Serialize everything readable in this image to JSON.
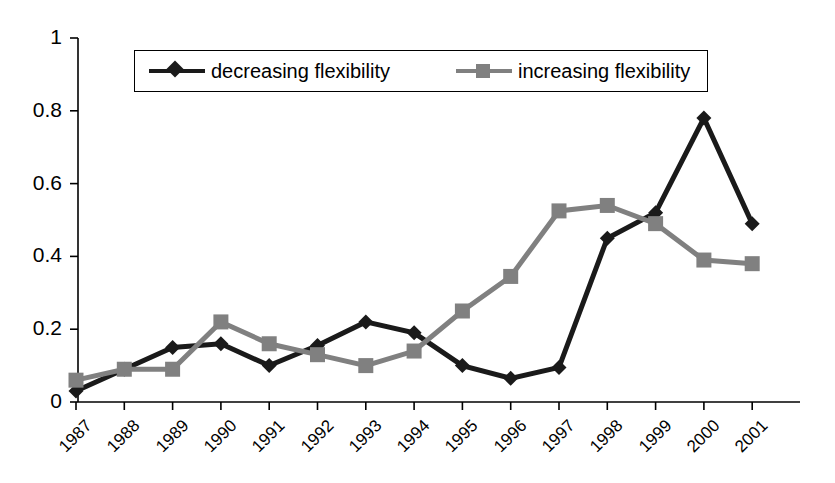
{
  "chart_data": {
    "type": "line",
    "title": "",
    "subtitle": "",
    "xlabel": "",
    "ylabel": "",
    "grid": false,
    "legend_position": "top-center",
    "ylim": [
      0,
      1
    ],
    "yticks": [
      "0",
      "0.2",
      "0.4",
      "0.6",
      "0.8",
      "1"
    ],
    "ytick_values": [
      0,
      0.2,
      0.4,
      0.6,
      0.8,
      1
    ],
    "categories": [
      "1987",
      "1988",
      "1989",
      "1990",
      "1991",
      "1992",
      "1993",
      "1994",
      "1995",
      "1996",
      "1997",
      "1998",
      "1999",
      "2000",
      "2001"
    ],
    "series": [
      {
        "name": "decreasing flexibility",
        "marker": "diamond",
        "color": "#1a1a1a",
        "values": [
          0.03,
          0.09,
          0.15,
          0.16,
          0.1,
          0.155,
          0.22,
          0.19,
          0.1,
          0.065,
          0.095,
          0.45,
          0.52,
          0.78,
          0.49
        ]
      },
      {
        "name": "increasing flexibility",
        "marker": "square",
        "color": "#808080",
        "values": [
          0.06,
          0.09,
          0.09,
          0.22,
          0.16,
          0.13,
          0.1,
          0.14,
          0.25,
          0.345,
          0.525,
          0.54,
          0.49,
          0.39,
          0.38
        ]
      }
    ]
  },
  "legend": {
    "entries": [
      {
        "label": "decreasing flexibility"
      },
      {
        "label": "increasing flexibility"
      }
    ]
  },
  "axis": {
    "y_axis_name": "value-axis",
    "x_axis_name": "year-axis"
  }
}
